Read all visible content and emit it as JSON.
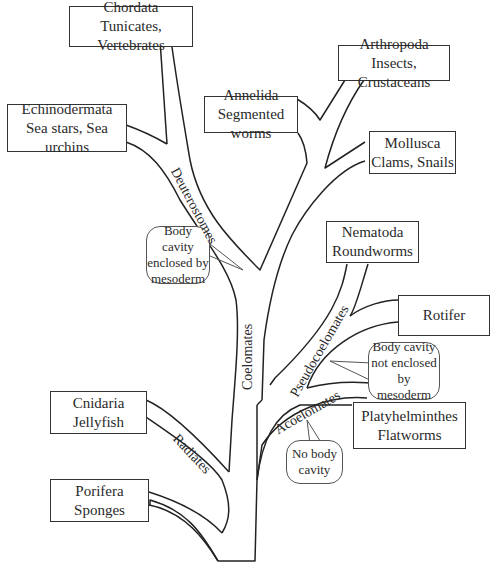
{
  "taxa": {
    "chordata": {
      "name": "Chordata",
      "examples": "Tunicates, Vertebrates"
    },
    "echinodermata": {
      "name": "Echinodermata",
      "examples": "Sea stars, Sea urchins"
    },
    "annelida": {
      "name": "Annelida",
      "examples": "Segmented worms"
    },
    "arthropoda": {
      "name": "Arthropoda",
      "examples": "Insects, Crustaceans"
    },
    "mollusca": {
      "name": "Mollusca",
      "examples": "Clams, Snails"
    },
    "nematoda": {
      "name": "Nematoda",
      "examples": "Roundworms"
    },
    "rotifer": {
      "name": "Rotifer"
    },
    "platyhelminthes": {
      "name": "Platyhelminthes",
      "examples": "Flatworms"
    },
    "cnidaria": {
      "name": "Cnidaria",
      "examples": "Jellyfish"
    },
    "porifera": {
      "name": "Porifera",
      "examples": "Sponges"
    }
  },
  "branch_labels": {
    "deuterostomes": "Deuterostomes",
    "coelomates": "Coelomates",
    "pseudocoelomates": "Pseudocoelomates",
    "acoelomates": "Acoelomates",
    "radiates": "Radiates"
  },
  "callouts": {
    "coelom": [
      "Body cavity",
      "enclosed by",
      "mesoderm"
    ],
    "pseudocoelom": [
      "Body cavity",
      "not enclosed",
      "by mesoderm"
    ],
    "acoelom": [
      "No body",
      "cavity"
    ]
  }
}
